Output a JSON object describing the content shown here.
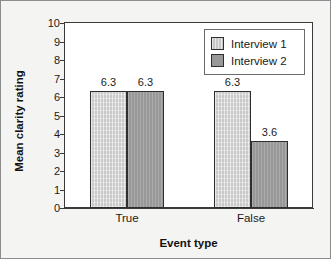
{
  "chart_data": {
    "type": "bar",
    "title": "",
    "xlabel": "Event type",
    "ylabel": "Mean clarity rating",
    "categories": [
      "True",
      "False"
    ],
    "series": [
      {
        "name": "Interview 1",
        "values": [
          6.3,
          6.3
        ],
        "color": "#c9c9c9"
      },
      {
        "name": "Interview 2",
        "values": [
          6.3,
          3.6
        ],
        "color": "#989898"
      }
    ],
    "ylim": [
      0,
      10
    ],
    "ytick_step": 1,
    "yticks": [
      "10",
      "9",
      "8",
      "7",
      "6",
      "5",
      "4",
      "3",
      "2",
      "1",
      "0"
    ],
    "grid": false,
    "legend_position": "top-right",
    "data_labels": [
      {
        "text": "6.3",
        "category": "True",
        "series": "Interview 1"
      },
      {
        "text": "6.3",
        "category": "True",
        "series": "Interview 2"
      },
      {
        "text": "2.8",
        "category": "False",
        "series": "Interview 1"
      },
      {
        "text": "3.6",
        "category": "False",
        "series": "Interview 2"
      }
    ]
  },
  "legend": {
    "entries": [
      {
        "label": "Interview 1"
      },
      {
        "label": "Interview 2"
      }
    ]
  },
  "axes": {
    "y_title": "Mean clarity rating",
    "x_title": "Event type"
  }
}
